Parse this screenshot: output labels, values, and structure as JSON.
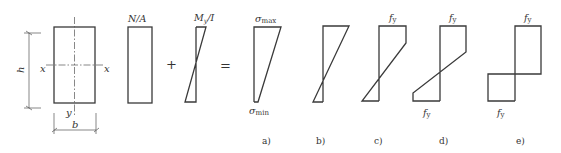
{
  "figure": {
    "section": {
      "dim_height": "h",
      "dim_width": "b",
      "axis_x_left": "x",
      "axis_x_right": "x",
      "axis_y": "y"
    },
    "term_axial": {
      "label_main": "N/A"
    },
    "operator_plus": "+",
    "term_bending": {
      "label_main": "M",
      "label_sub": "y",
      "label_tail": "/I"
    },
    "operator_equals": "=",
    "panel_a": {
      "top_label_main": "σ",
      "top_label_sub": "max",
      "bottom_label_main": "σ",
      "bottom_label_sub": "min",
      "caption": "a)"
    },
    "panel_b": {
      "caption": "b)"
    },
    "panel_c": {
      "top_label_main": "f",
      "top_label_sub": "y",
      "caption": "c)"
    },
    "panel_d": {
      "top_label_main": "f",
      "top_label_sub": "y",
      "bottom_label_main": "f",
      "bottom_label_sub": "y",
      "caption": "d)"
    },
    "panel_e": {
      "top_label_main": "f",
      "top_label_sub": "y",
      "bottom_label_main": "f",
      "bottom_label_sub": "y",
      "caption": "e)"
    }
  }
}
